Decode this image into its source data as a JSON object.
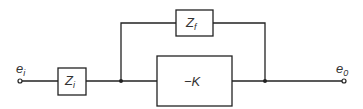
{
  "diagram": {
    "type": "block-diagram",
    "input": {
      "symbol": "e",
      "subscript": "i"
    },
    "output": {
      "symbol": "e",
      "subscript": "0"
    },
    "blocks": [
      {
        "id": "zi",
        "symbol": "Z",
        "subscript": "i"
      },
      {
        "id": "zf",
        "symbol": "Z",
        "subscript": "f"
      },
      {
        "id": "gain",
        "label": "−K"
      }
    ],
    "connections": [
      "e_i -> Z_i",
      "Z_i -> junction_left",
      "junction_left -> -K",
      "junction_left -> Z_f",
      "-K -> junction_right",
      "Z_f -> junction_right",
      "junction_right -> e_0"
    ],
    "colors": {
      "line": "#222222",
      "background": "#ffffff"
    }
  }
}
